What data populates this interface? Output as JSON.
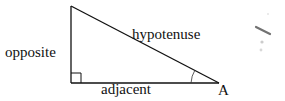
{
  "diagram": {
    "type": "right-triangle",
    "labels": {
      "opposite": "opposite",
      "hypotenuse": "hypotenuse",
      "adjacent": "adjacent",
      "angle_vertex": "A"
    },
    "vertices": {
      "top": [
        71,
        6
      ],
      "right_angle": [
        71,
        83
      ],
      "angle_A": [
        219,
        83
      ]
    },
    "colors": {
      "line": "#111111",
      "text": "#111111",
      "smudge": "#555555"
    }
  }
}
